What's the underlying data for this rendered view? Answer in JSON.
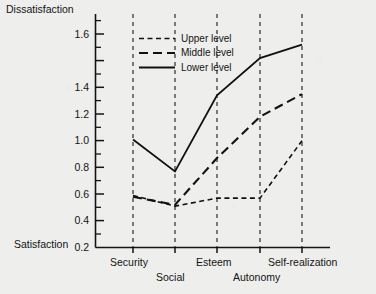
{
  "chart_data": {
    "type": "line",
    "title": "",
    "ylabel_top": "Dissatisfaction",
    "ylabel_bottom": "Satisfaction",
    "xlabel": "",
    "categories": [
      "Security",
      "Social",
      "Esteem",
      "Autonomy",
      "Self-realization"
    ],
    "ylim": [
      0,
      1.72
    ],
    "ytick_labels": [
      "0.2",
      "0.4",
      "0.6",
      "0.8",
      "1.0",
      "1.2",
      "1.4",
      "1.6"
    ],
    "ytick_values": [
      0.2,
      0.4,
      0.6,
      0.8,
      1.0,
      1.2,
      1.4,
      1.6
    ],
    "minor_ticks": true,
    "grid": "vertical-dashed-at-categories",
    "legend_position": "upper-left-inside",
    "series": [
      {
        "name": "Upper level",
        "style": "dotted-dash",
        "values": [
          0.39,
          0.31,
          0.37,
          0.37,
          0.8
        ]
      },
      {
        "name": "Middle level",
        "style": "dashed",
        "values": [
          0.38,
          0.32,
          0.67,
          0.98,
          1.15
        ]
      },
      {
        "name": "Lower level",
        "style": "solid",
        "values": [
          0.81,
          0.57,
          1.14,
          1.42,
          1.52
        ]
      }
    ],
    "line_color": "#111111"
  },
  "legend": {
    "items": [
      {
        "label": "Upper level"
      },
      {
        "label": "Middle level"
      },
      {
        "label": "Lower level"
      }
    ]
  },
  "axis": {
    "top_label": "Dissatisfaction",
    "bottom_label": "Satisfaction"
  },
  "categories_layout": [
    {
      "label": "Security",
      "row": 0
    },
    {
      "label": "Social",
      "row": 1
    },
    {
      "label": "Esteem",
      "row": 0
    },
    {
      "label": "Autonomy",
      "row": 1
    },
    {
      "label": "Self-realization",
      "row": 0
    }
  ]
}
